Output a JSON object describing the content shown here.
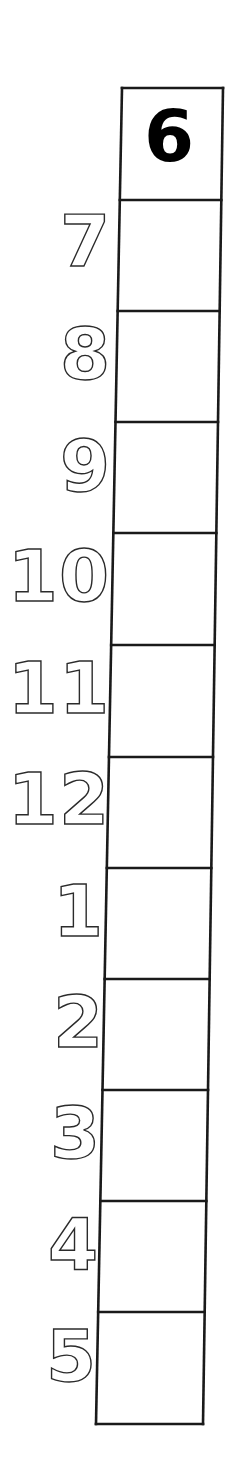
{
  "page": {
    "background_color": "#ffffff",
    "width": 231,
    "height": 1460
  },
  "grid": {
    "name": "numeral-cell-column",
    "cell_count": 12,
    "stroke_color": "#1a1a1a",
    "stroke_width": 2.6,
    "fill_color": "#ffffff",
    "note": "Single vertical column of 12 empty boxes, slightly skewed leftward toward the bottom",
    "outline_points": {
      "top_left": [
        122,
        88
      ],
      "top_right": [
        223,
        88
      ],
      "bottom_right": [
        203,
        1424
      ],
      "bottom_left": [
        96,
        1424
      ]
    },
    "row_dividers_y": [
      200,
      311,
      422,
      533,
      645,
      757,
      868,
      979,
      1090,
      1201,
      1312
    ],
    "cells": [
      {
        "index": 1,
        "value": "6",
        "filled": true,
        "top": 88,
        "bottom": 200
      },
      {
        "index": 2,
        "value": "",
        "filled": false,
        "top": 200,
        "bottom": 311
      },
      {
        "index": 3,
        "value": "",
        "filled": false,
        "top": 311,
        "bottom": 422
      },
      {
        "index": 4,
        "value": "",
        "filled": false,
        "top": 422,
        "bottom": 533
      },
      {
        "index": 5,
        "value": "",
        "filled": false,
        "top": 533,
        "bottom": 645
      },
      {
        "index": 6,
        "value": "",
        "filled": false,
        "top": 645,
        "bottom": 757
      },
      {
        "index": 7,
        "value": "",
        "filled": false,
        "top": 757,
        "bottom": 868
      },
      {
        "index": 8,
        "value": "",
        "filled": false,
        "top": 868,
        "bottom": 979
      },
      {
        "index": 9,
        "value": "",
        "filled": false,
        "top": 979,
        "bottom": 1090
      },
      {
        "index": 10,
        "value": "",
        "filled": false,
        "top": 1090,
        "bottom": 1201
      },
      {
        "index": 11,
        "value": "",
        "filled": false,
        "top": 1201,
        "bottom": 1312
      },
      {
        "index": 12,
        "value": "",
        "filled": false,
        "top": 1312,
        "bottom": 1424
      }
    ]
  },
  "filled_numeral": {
    "text": "6",
    "color": "#000000",
    "left": 144,
    "top": 100
  },
  "trace_labels": {
    "style": "hollow-outline",
    "outline_color": "#2b2b2b",
    "fill_color": "transparent",
    "items": [
      {
        "text": "7",
        "right": 110,
        "top": 205,
        "digits": 1
      },
      {
        "text": "8",
        "right": 110,
        "top": 318,
        "digits": 1
      },
      {
        "text": "9",
        "right": 110,
        "top": 430,
        "digits": 1
      },
      {
        "text": "10",
        "right": 110,
        "top": 540,
        "digits": 2
      },
      {
        "text": "11",
        "right": 110,
        "top": 652,
        "digits": 2
      },
      {
        "text": "12",
        "right": 110,
        "top": 763,
        "digits": 2
      },
      {
        "text": "1",
        "right": 103,
        "top": 875,
        "digits": 1
      },
      {
        "text": "2",
        "right": 103,
        "top": 986,
        "digits": 1
      },
      {
        "text": "3",
        "right": 100,
        "top": 1097,
        "digits": 1
      },
      {
        "text": "4",
        "right": 98,
        "top": 1208,
        "digits": 1
      },
      {
        "text": "5",
        "right": 96,
        "top": 1320,
        "digits": 1
      }
    ]
  }
}
